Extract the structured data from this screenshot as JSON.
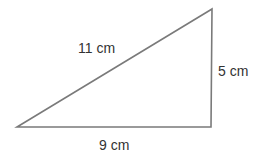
{
  "diagram": {
    "type": "right triangle",
    "stroke_color": "#7a7a7a",
    "text_color": "#333333",
    "vertices": {
      "bottom_left": [
        17,
        127
      ],
      "bottom_right": [
        211,
        127
      ],
      "top_right": [
        212,
        9
      ]
    },
    "labels": {
      "hypotenuse": "11 cm",
      "vertical_side": "5 cm",
      "base": "9 cm"
    }
  }
}
